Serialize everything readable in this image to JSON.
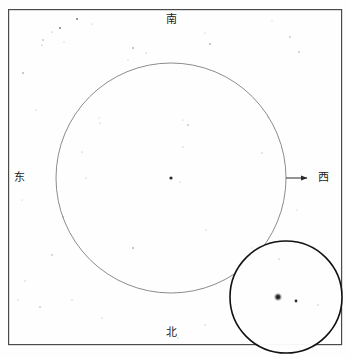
{
  "plate": {
    "title": "star chart plate",
    "background_color": "#fefefe",
    "frame": {
      "x": 8,
      "y": 9,
      "width": 333,
      "height": 335,
      "stroke_color": "#4a4a4a",
      "stroke_width": 1.2
    }
  },
  "cardinals": {
    "south": {
      "label": "南",
      "position": "top"
    },
    "east": {
      "label": "东",
      "position": "left"
    },
    "west": {
      "label": "西",
      "position": "right"
    },
    "north": {
      "label": "北",
      "position": "bottom"
    }
  },
  "main_circle": {
    "cx": 171,
    "cy": 178,
    "r": 115,
    "stroke_color": "#8c8c8c",
    "stroke_width": 1
  },
  "inset_circle": {
    "cx": 286,
    "cy": 297,
    "r": 56,
    "stroke_color": "#111111",
    "stroke_width": 1.6
  },
  "arrow": {
    "x1": 286,
    "y1": 178,
    "x2": 312,
    "y2": 178,
    "stroke_color": "#2a2a2a",
    "direction": "right"
  },
  "markers": {
    "main_center_dot": {
      "cx": 171,
      "cy": 178,
      "r": 1.6,
      "color": "#2a2a2a"
    },
    "inset_fuzzy_star": {
      "cx": 278,
      "cy": 297,
      "r": 3.4,
      "color": "#3a3a3a"
    },
    "inset_small_dot": {
      "cx": 296,
      "cy": 301,
      "r": 1.4,
      "color": "#2a2a2a"
    }
  },
  "starfield": [
    {
      "cx": 77,
      "cy": 19,
      "r": 0.9,
      "o": 0.75
    },
    {
      "cx": 92,
      "cy": 24,
      "r": 0.5,
      "o": 0.45
    },
    {
      "cx": 52,
      "cy": 32,
      "r": 0.6,
      "o": 0.5
    },
    {
      "cx": 60,
      "cy": 28,
      "r": 0.9,
      "o": 0.7
    },
    {
      "cx": 42,
      "cy": 45,
      "r": 0.6,
      "o": 0.5
    },
    {
      "cx": 64,
      "cy": 42,
      "r": 0.5,
      "o": 0.4
    },
    {
      "cx": 43,
      "cy": 40,
      "r": 0.7,
      "o": 0.55
    },
    {
      "cx": 23,
      "cy": 73,
      "r": 0.8,
      "o": 0.6
    },
    {
      "cx": 133,
      "cy": 48,
      "r": 0.8,
      "o": 0.6
    },
    {
      "cx": 146,
      "cy": 53,
      "r": 0.6,
      "o": 0.45
    },
    {
      "cx": 128,
      "cy": 60,
      "r": 0.5,
      "o": 0.4
    },
    {
      "cx": 210,
      "cy": 44,
      "r": 0.8,
      "o": 0.6
    },
    {
      "cx": 205,
      "cy": 33,
      "r": 0.5,
      "o": 0.4
    },
    {
      "cx": 290,
      "cy": 37,
      "r": 0.7,
      "o": 0.5
    },
    {
      "cx": 299,
      "cy": 52,
      "r": 0.7,
      "o": 0.55
    },
    {
      "cx": 272,
      "cy": 21,
      "r": 0.5,
      "o": 0.35
    },
    {
      "cx": 36,
      "cy": 110,
      "r": 0.6,
      "o": 0.45
    },
    {
      "cx": 100,
      "cy": 123,
      "r": 0.6,
      "o": 0.45
    },
    {
      "cx": 99,
      "cy": 118,
      "r": 0.5,
      "o": 0.4
    },
    {
      "cx": 188,
      "cy": 125,
      "r": 0.7,
      "o": 0.55
    },
    {
      "cx": 183,
      "cy": 120,
      "r": 0.5,
      "o": 0.4
    },
    {
      "cx": 268,
      "cy": 117,
      "r": 0.6,
      "o": 0.45
    },
    {
      "cx": 82,
      "cy": 152,
      "r": 0.6,
      "o": 0.45
    },
    {
      "cx": 86,
      "cy": 178,
      "r": 0.6,
      "o": 0.45
    },
    {
      "cx": 183,
      "cy": 147,
      "r": 0.6,
      "o": 0.45
    },
    {
      "cx": 262,
      "cy": 153,
      "r": 0.6,
      "o": 0.5
    },
    {
      "cx": 22,
      "cy": 200,
      "r": 0.5,
      "o": 0.4
    },
    {
      "cx": 63,
      "cy": 217,
      "r": 0.7,
      "o": 0.55
    },
    {
      "cx": 180,
      "cy": 182,
      "r": 0.6,
      "o": 0.45
    },
    {
      "cx": 206,
      "cy": 230,
      "r": 0.6,
      "o": 0.45
    },
    {
      "cx": 133,
      "cy": 248,
      "r": 0.8,
      "o": 0.6
    },
    {
      "cx": 52,
      "cy": 255,
      "r": 0.7,
      "o": 0.5
    },
    {
      "cx": 25,
      "cy": 281,
      "r": 0.6,
      "o": 0.45
    },
    {
      "cx": 40,
      "cy": 307,
      "r": 0.7,
      "o": 0.5
    },
    {
      "cx": 18,
      "cy": 300,
      "r": 0.5,
      "o": 0.4
    },
    {
      "cx": 72,
      "cy": 300,
      "r": 0.6,
      "o": 0.45
    },
    {
      "cx": 102,
      "cy": 318,
      "r": 0.6,
      "o": 0.45
    },
    {
      "cx": 205,
      "cy": 325,
      "r": 0.6,
      "o": 0.45
    },
    {
      "cx": 178,
      "cy": 338,
      "r": 0.6,
      "o": 0.45
    },
    {
      "cx": 252,
      "cy": 248,
      "r": 0.5,
      "o": 0.4
    },
    {
      "cx": 289,
      "cy": 252,
      "r": 0.5,
      "o": 0.4
    },
    {
      "cx": 316,
      "cy": 302,
      "r": 0.5,
      "o": 0.4
    },
    {
      "cx": 331,
      "cy": 308,
      "r": 0.5,
      "o": 0.35
    },
    {
      "cx": 297,
      "cy": 210,
      "r": 0.5,
      "o": 0.4
    }
  ]
}
